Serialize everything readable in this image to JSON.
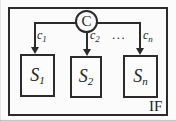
{
  "diagram": {
    "controller": {
      "label": "C"
    },
    "edge_labels": [
      {
        "base": "c",
        "sub": "1"
      },
      {
        "base": "c",
        "sub": "2"
      },
      {
        "base": "c",
        "sub": "n"
      }
    ],
    "ellipsis": "...",
    "boxes": [
      {
        "base": "S",
        "sub": "1"
      },
      {
        "base": "S",
        "sub": "2"
      },
      {
        "base": "S",
        "sub": "n"
      }
    ],
    "frame_label": "IF",
    "colors": {
      "line": "#2b2b2b",
      "background": "#fbfbfb",
      "node_fill": "#fcfcfc"
    }
  }
}
